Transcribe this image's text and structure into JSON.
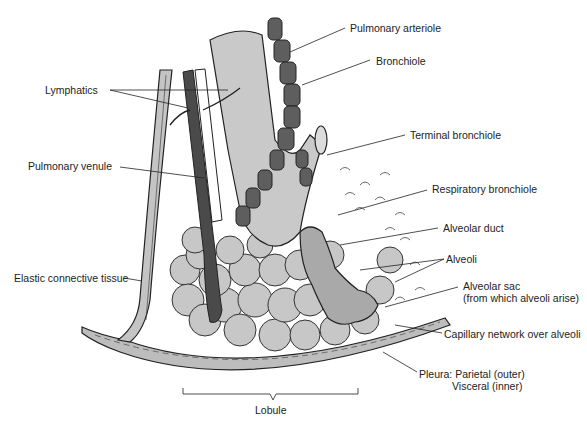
{
  "diagram": {
    "labels": {
      "pulmonary_arteriole": "Pulmonary arteriole",
      "bronchiole": "Bronchiole",
      "lymphatics": "Lymphatics",
      "terminal_bronchiole": "Terminal bronchiole",
      "pulmonary_venule": "Pulmonary venule",
      "respiratory_bronchiole": "Respiratory bronchiole",
      "alveolar_duct": "Alveolar duct",
      "alveoli": "Alveoli",
      "alveolar_sac_line1": "Alveolar sac",
      "alveolar_sac_line2": "(from which alveoli arise)",
      "elastic_connective_tissue": "Elastic connective tissue",
      "capillary_network": "Capillary network over alveoli",
      "pleura_line1": "Pleura: Parietal (outer)",
      "pleura_line2": "Visceral (inner)",
      "lobule": "Lobule"
    },
    "colors": {
      "background": "#ffffff",
      "light_tissue": "#c9c9c9",
      "medium_tissue": "#a8a8a8",
      "dark_vessel": "#5a5a5a",
      "outline": "#1a1a1a",
      "label_text": "#222222"
    }
  }
}
